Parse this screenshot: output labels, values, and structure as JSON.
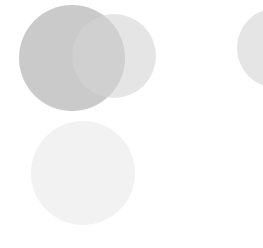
{
  "canvas": {
    "width": 263,
    "height": 248,
    "background": "#ffffff"
  },
  "shapes": [
    {
      "id": "circle-large-left",
      "cx": 72,
      "cy": 58,
      "r": 53,
      "fill": "#c4c4c4",
      "opacity": 0.9
    },
    {
      "id": "circle-right-overlap",
      "cx": 114,
      "cy": 56,
      "r": 42,
      "fill": "#d4d4d4",
      "opacity": 0.6
    },
    {
      "id": "circle-bottom-faint",
      "cx": 83,
      "cy": 173,
      "r": 52,
      "fill": "#f2f2f2",
      "opacity": 1
    },
    {
      "id": "circle-right-edge-partial",
      "cx": 277,
      "cy": 48,
      "r": 40,
      "fill": "#e5e5e5",
      "opacity": 1
    }
  ]
}
